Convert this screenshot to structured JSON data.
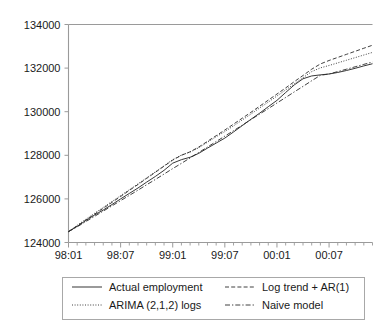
{
  "chart_data": {
    "type": "line",
    "title": "",
    "xlabel": "",
    "ylabel": "",
    "ylim": [
      124000,
      134000
    ],
    "ytick_values": [
      124000,
      126000,
      128000,
      130000,
      132000,
      134000
    ],
    "ytick_labels": [
      "124000",
      "126000",
      "128000",
      "130000",
      "132000",
      "134000"
    ],
    "xlim": [
      "98:01",
      "00:12"
    ],
    "xtick_labels": [
      "98:01",
      "98:07",
      "99:01",
      "99:07",
      "00:01",
      "00:07"
    ],
    "xtick_positions_months": [
      0,
      6,
      12,
      18,
      24,
      30
    ],
    "x_minor_tick_count": 36,
    "grid": false,
    "legend_position": "below-plot",
    "x_months": [
      "98:01",
      "98:02",
      "98:03",
      "98:04",
      "98:05",
      "98:06",
      "98:07",
      "98:08",
      "98:09",
      "98:10",
      "98:11",
      "98:12",
      "99:01",
      "99:02",
      "99:03",
      "99:04",
      "99:05",
      "99:06",
      "99:07",
      "99:08",
      "99:09",
      "99:10",
      "99:11",
      "99:12",
      "00:01",
      "00:02",
      "00:03",
      "00:04",
      "00:05",
      "00:06",
      "00:07",
      "00:08",
      "00:09",
      "00:10",
      "00:11",
      "00:12"
    ],
    "series": [
      {
        "name": "Actual employment",
        "style": "solid",
        "color": "#2b2b2b",
        "values": [
          124500,
          124740,
          125010,
          125260,
          125490,
          125740,
          126000,
          126250,
          126500,
          126770,
          127030,
          127310,
          127640,
          127800,
          127910,
          128090,
          128330,
          128560,
          128790,
          129070,
          129360,
          129650,
          129930,
          130230,
          130520,
          130880,
          131230,
          131510,
          131640,
          131690,
          131730,
          131800,
          131890,
          131990,
          132100,
          132200
        ]
      },
      {
        "name": "ARIMA (2,1,2) logs",
        "style": "dotted",
        "color": "#2b2b2b",
        "values": [
          124500,
          124790,
          125070,
          125340,
          125610,
          125880,
          126150,
          126420,
          126690,
          126970,
          127240,
          127520,
          127800,
          128010,
          128150,
          128350,
          128600,
          128850,
          129090,
          129350,
          129620,
          129890,
          130170,
          130440,
          130720,
          131000,
          131280,
          131560,
          131840,
          132010,
          132120,
          132240,
          132360,
          132480,
          132600,
          132720
        ]
      },
      {
        "name": "Log trend + AR(1)",
        "style": "dashed",
        "color": "#2b2b2b",
        "values": [
          124500,
          124760,
          125030,
          125300,
          125570,
          125840,
          126110,
          126390,
          126660,
          126940,
          127220,
          127500,
          127780,
          128000,
          128160,
          128380,
          128640,
          128900,
          129160,
          129430,
          129700,
          129970,
          130250,
          130530,
          130810,
          131090,
          131380,
          131660,
          131950,
          132190,
          132350,
          132490,
          132630,
          132770,
          132910,
          133050
        ]
      },
      {
        "name": "Naive model",
        "style": "dashdot",
        "color": "#2b2b2b",
        "values": [
          124500,
          124720,
          124960,
          125200,
          125440,
          125680,
          125920,
          126160,
          126400,
          126650,
          126890,
          127140,
          127390,
          127630,
          127880,
          128130,
          128380,
          128630,
          128880,
          129130,
          129380,
          129640,
          129890,
          130140,
          130400,
          130650,
          130910,
          131160,
          131420,
          131670,
          131730,
          131840,
          131950,
          132060,
          132170,
          132280
        ]
      }
    ]
  },
  "legend": {
    "entries": [
      {
        "label": "Actual employment",
        "style": "solid"
      },
      {
        "label": "Log trend + AR(1)",
        "style": "dashed"
      },
      {
        "label": "ARIMA (2,1,2) logs",
        "style": "dotted"
      },
      {
        "label": "Naive model",
        "style": "dashdot"
      }
    ]
  }
}
